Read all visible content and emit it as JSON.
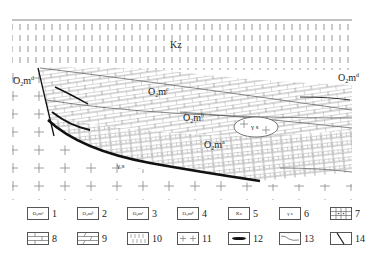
{
  "diagram": {
    "type": "geological-cross-section",
    "units": {
      "kz": {
        "text": "Kz"
      },
      "o2md_left": {
        "base": "O",
        "sub": "2",
        "m": "m",
        "sup": "d"
      },
      "o2md_right": {
        "base": "O",
        "sub": "2",
        "m": "m",
        "sup": "d"
      },
      "o2mc": {
        "base": "O",
        "sub": "2",
        "m": "m",
        "sup": "c"
      },
      "o2mb": {
        "base": "O",
        "sub": "2",
        "m": "m",
        "sup": "b"
      },
      "o2ma": {
        "base": "O",
        "sub": "2",
        "m": "m",
        "sup": "a"
      },
      "gamma_s_1": {
        "text": "γ s"
      },
      "gamma_s_2": {
        "text": "γ s"
      }
    }
  },
  "legend": {
    "items": [
      {
        "num": "1",
        "box": "O₂mᵃ",
        "pattern": "label"
      },
      {
        "num": "2",
        "box": "O₂mᵇ",
        "pattern": "label"
      },
      {
        "num": "3",
        "box": "O₂mᶜ",
        "pattern": "label"
      },
      {
        "num": "4",
        "box": "O₂mᵈ",
        "pattern": "label"
      },
      {
        "num": "5",
        "box": "Kz",
        "pattern": "label"
      },
      {
        "num": "6",
        "box": "γ s",
        "pattern": "label"
      },
      {
        "num": "7",
        "box": "",
        "pattern": "dolomite-grid"
      },
      {
        "num": "8",
        "box": "",
        "pattern": "limestone"
      },
      {
        "num": "9",
        "box": "",
        "pattern": "dolomitic-limestone"
      },
      {
        "num": "10",
        "box": "",
        "pattern": "loess"
      },
      {
        "num": "11",
        "box": "",
        "pattern": "granite-cross"
      },
      {
        "num": "12",
        "box": "",
        "pattern": "coal-lens"
      },
      {
        "num": "13",
        "box": "",
        "pattern": "unconformity-boundary"
      },
      {
        "num": "14",
        "box": "",
        "pattern": "fault"
      }
    ]
  }
}
